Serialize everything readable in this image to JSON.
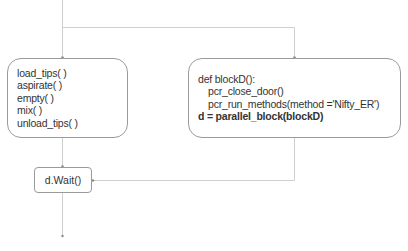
{
  "diagram": {
    "left_block": {
      "lines": [
        "load_tips( )",
        "aspirate( )",
        "empty( )",
        "mix( )",
        "unload_tips( )"
      ]
    },
    "right_block": {
      "lines": [
        {
          "text": "def blockD():",
          "indent": false,
          "bold": false
        },
        {
          "text": "pcr_close_door()",
          "indent": true,
          "bold": false
        },
        {
          "text": "pcr_run_methods(method ='Nifty_ER')",
          "indent": true,
          "bold": false
        },
        {
          "text": "d = parallel_block(blockD)",
          "indent": false,
          "bold": true
        }
      ]
    },
    "wait_block": {
      "label": "d.Wait()"
    },
    "colors": {
      "line": "#c8c8c8",
      "border": "#9a9a9a",
      "text": "#333333",
      "arrow": "#888888"
    }
  }
}
